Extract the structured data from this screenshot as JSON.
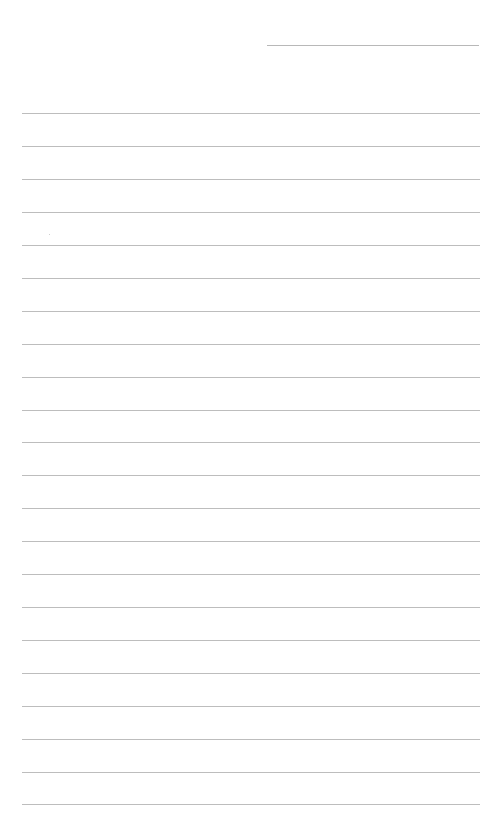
{
  "document": {
    "type": "blank lined writing paper",
    "header_line": {
      "x": 267,
      "y": 45,
      "width": 212
    },
    "rule_color": "#bdbdbd",
    "background_color": "#ffffff",
    "rules": {
      "left": 22,
      "width": 458,
      "y_positions": [
        113,
        146,
        179,
        212,
        245,
        278,
        311,
        344,
        377,
        410,
        442,
        475,
        508,
        541,
        574,
        607,
        640,
        673,
        706,
        739,
        772,
        804
      ]
    }
  }
}
